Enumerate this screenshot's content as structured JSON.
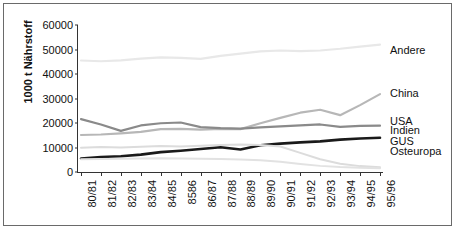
{
  "chart_data": {
    "type": "line",
    "title": "",
    "xlabel": "",
    "ylabel": "1000 t Nährstoff",
    "ylim": [
      0,
      60000
    ],
    "ytick_values": [
      0,
      10000,
      20000,
      30000,
      40000,
      50000,
      60000
    ],
    "ytick_labels": [
      "0",
      "10000",
      "20000",
      "30000",
      "40000",
      "50000",
      "60000"
    ],
    "grid": false,
    "legend_position": "right-inline",
    "categories": [
      "80/81",
      "81/82",
      "82/83",
      "83/84",
      "84/85",
      "8586",
      "86/87",
      "87/88",
      "88/89",
      "89/90",
      "90/91",
      "91/92",
      "92/93",
      "93/94",
      "94/95",
      "95/96"
    ],
    "series": [
      {
        "name": "Andere",
        "color": "#e8e8e8",
        "width": 2.2,
        "values": [
          45500,
          45200,
          45600,
          46300,
          46800,
          46600,
          46200,
          47400,
          48300,
          49200,
          49600,
          49300,
          49600,
          50300,
          51200,
          52000
        ]
      },
      {
        "name": "China",
        "color": "#b7b7b7",
        "width": 2.2,
        "values": [
          15100,
          15300,
          15800,
          16400,
          17500,
          17600,
          17300,
          17600,
          17500,
          19900,
          22100,
          24200,
          25400,
          23200,
          27300,
          31800
        ]
      },
      {
        "name": "USA",
        "color": "#8a8a8a",
        "width": 2.2,
        "values": [
          21600,
          19400,
          16800,
          19000,
          19900,
          20200,
          18300,
          17900,
          17700,
          18200,
          18600,
          19000,
          19400,
          18400,
          18800,
          18900
        ]
      },
      {
        "name": "Indien",
        "color": "#1a1a1a",
        "width": 2.6,
        "values": [
          5500,
          6100,
          6400,
          7100,
          8100,
          8700,
          9400,
          10100,
          9200,
          10900,
          11600,
          12100,
          12500,
          13200,
          13700,
          14000
        ]
      },
      {
        "name": "GUS",
        "color": "#dcdcdc",
        "width": 2.0,
        "values": [
          9900,
          10200,
          10000,
          10300,
          10600,
          10400,
          10700,
          11000,
          11200,
          11000,
          10400,
          7800,
          5200,
          3400,
          2400,
          1900
        ]
      },
      {
        "name": "Osteuropa",
        "color": "#e2e2e2",
        "width": 2.0,
        "values": [
          5200,
          5300,
          5400,
          5500,
          5600,
          5500,
          5400,
          5300,
          5100,
          4800,
          4200,
          3300,
          2500,
          2000,
          1700,
          1500
        ]
      }
    ],
    "annotations": [
      {
        "text": "Andere",
        "series": "Andere",
        "y_value": 49500
      },
      {
        "text": "China",
        "series": "China",
        "y_value": 31800
      },
      {
        "text": "USA",
        "series": "USA",
        "y_value": 20300
      },
      {
        "text": "Indien",
        "series": "Indien",
        "y_value": 16600
      },
      {
        "text": "GUS",
        "series": "GUS",
        "y_value": 12200
      },
      {
        "text": "Osteuropa",
        "series": "Osteuropa",
        "y_value": 8200
      }
    ]
  }
}
